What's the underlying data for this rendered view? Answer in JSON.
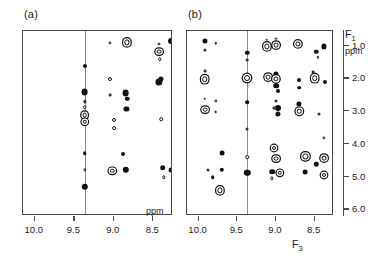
{
  "figure": {
    "panels": [
      {
        "label": "(a)",
        "xaxis": {
          "ticks": [
            "10.0",
            "9.5",
            "9.0",
            "8.5"
          ],
          "tick_ppm": [
            10.0,
            9.5,
            9.0,
            8.5
          ],
          "unit": "ppm",
          "title": "",
          "range": [
            10.15,
            8.25
          ]
        },
        "yaxis": {
          "ticks": [],
          "title": "",
          "unit": "",
          "range": [
            0.55,
            6.2
          ]
        },
        "reference_line_ppm": 9.37
      },
      {
        "label": "(b)",
        "xaxis": {
          "ticks": [
            "10.0",
            "9.5",
            "9.0",
            "8.5"
          ],
          "tick_ppm": [
            10.0,
            9.5,
            9.0,
            8.5
          ],
          "unit": "",
          "title": "F",
          "title_sub": "3",
          "range": [
            10.15,
            8.25
          ]
        },
        "yaxis": {
          "ticks": [
            "1.0",
            "2.0",
            "3.0",
            "4.0",
            "5.0",
            "6.0"
          ],
          "tick_ppm": [
            1.0,
            2.0,
            3.0,
            4.0,
            5.0,
            6.0
          ],
          "title": "F",
          "title_sub": "1",
          "unit": "ppm",
          "range": [
            0.55,
            6.2
          ]
        },
        "reference_line_ppm": 9.37
      }
    ]
  },
  "chart_data": {
    "type": "scatter",
    "title": "",
    "xlabel": "F3 (ppm)",
    "ylabel": "F1 (ppm)",
    "xlim": [
      10.15,
      8.25
    ],
    "ylim": [
      0.55,
      6.2
    ],
    "x_inverted": true,
    "y_inverted": true,
    "grid": false,
    "legend": null,
    "panels": [
      {
        "name": "(a)",
        "reference_line_x": 9.37,
        "peaks": [
          {
            "x": 9.05,
            "y": 0.92,
            "r": 1.6,
            "style": "ring"
          },
          {
            "x": 8.83,
            "y": 0.9,
            "r": 2.6,
            "style": "ring2"
          },
          {
            "x": 8.43,
            "y": 0.95,
            "r": 1.5,
            "style": "ring"
          },
          {
            "x": 8.43,
            "y": 1.18,
            "r": 2.4,
            "style": "ring2"
          },
          {
            "x": 8.42,
            "y": 1.42,
            "r": 1.8,
            "style": "ring"
          },
          {
            "x": 8.28,
            "y": 0.85,
            "r": 3.0,
            "style": "filled"
          },
          {
            "x": 9.37,
            "y": 1.62,
            "r": 2.0,
            "style": "filled"
          },
          {
            "x": 9.05,
            "y": 2.02,
            "r": 2.0,
            "style": "ring"
          },
          {
            "x": 8.43,
            "y": 2.1,
            "r": 3.6,
            "style": "filled"
          },
          {
            "x": 8.4,
            "y": 2.02,
            "r": 2.6,
            "style": "filled"
          },
          {
            "x": 9.37,
            "y": 2.42,
            "r": 3.4,
            "style": "filled"
          },
          {
            "x": 9.05,
            "y": 2.5,
            "r": 1.4,
            "style": "tiny"
          },
          {
            "x": 8.85,
            "y": 2.44,
            "r": 3.4,
            "style": "filled"
          },
          {
            "x": 8.83,
            "y": 2.62,
            "r": 2.2,
            "style": "filled"
          },
          {
            "x": 9.37,
            "y": 2.7,
            "r": 1.6,
            "style": "tiny"
          },
          {
            "x": 9.37,
            "y": 2.88,
            "r": 1.8,
            "style": "ring"
          },
          {
            "x": 8.84,
            "y": 2.92,
            "r": 2.6,
            "style": "filled"
          },
          {
            "x": 9.37,
            "y": 3.12,
            "r": 2.4,
            "style": "ring2"
          },
          {
            "x": 9.37,
            "y": 3.32,
            "r": 2.2,
            "style": "ring2"
          },
          {
            "x": 9.0,
            "y": 3.28,
            "r": 2.0,
            "style": "ring"
          },
          {
            "x": 9.0,
            "y": 3.52,
            "r": 1.9,
            "style": "ring"
          },
          {
            "x": 8.4,
            "y": 3.25,
            "r": 1.8,
            "style": "ring"
          },
          {
            "x": 9.37,
            "y": 4.28,
            "r": 1.8,
            "style": "filled"
          },
          {
            "x": 8.88,
            "y": 4.32,
            "r": 2.0,
            "style": "filled"
          },
          {
            "x": 9.37,
            "y": 4.78,
            "r": 1.7,
            "style": "ring"
          },
          {
            "x": 9.02,
            "y": 4.82,
            "r": 2.2,
            "style": "ring2"
          },
          {
            "x": 8.85,
            "y": 4.78,
            "r": 3.2,
            "style": "filled"
          },
          {
            "x": 8.38,
            "y": 4.72,
            "r": 2.8,
            "style": "filled"
          },
          {
            "x": 8.37,
            "y": 5.02,
            "r": 1.7,
            "style": "ring"
          },
          {
            "x": 8.27,
            "y": 4.8,
            "r": 2.4,
            "style": "filled"
          },
          {
            "x": 9.37,
            "y": 5.3,
            "r": 3.2,
            "style": "filled"
          }
        ]
      },
      {
        "name": "(b)",
        "reference_line_x": 9.37,
        "peaks": [
          {
            "x": 9.92,
            "y": 0.85,
            "r": 2.6,
            "style": "filled"
          },
          {
            "x": 9.92,
            "y": 1.12,
            "r": 1.6,
            "style": "tiny"
          },
          {
            "x": 9.78,
            "y": 0.92,
            "r": 1.2,
            "style": "tiny"
          },
          {
            "x": 9.37,
            "y": 1.22,
            "r": 2.2,
            "style": "filled"
          },
          {
            "x": 9.12,
            "y": 0.82,
            "r": 1.3,
            "style": "tiny"
          },
          {
            "x": 9.12,
            "y": 1.02,
            "r": 2.6,
            "style": "ring2"
          },
          {
            "x": 9.0,
            "y": 0.78,
            "r": 1.4,
            "style": "ring"
          },
          {
            "x": 9.0,
            "y": 0.98,
            "r": 2.4,
            "style": "ring2"
          },
          {
            "x": 8.72,
            "y": 0.95,
            "r": 2.6,
            "style": "ring2"
          },
          {
            "x": 8.48,
            "y": 1.18,
            "r": 2.2,
            "style": "filled"
          },
          {
            "x": 8.38,
            "y": 1.02,
            "r": 2.6,
            "style": "filled"
          },
          {
            "x": 8.46,
            "y": 1.35,
            "r": 1.2,
            "style": "tiny"
          },
          {
            "x": 9.37,
            "y": 1.45,
            "r": 1.4,
            "style": "tiny"
          },
          {
            "x": 9.92,
            "y": 1.78,
            "r": 1.4,
            "style": "tiny"
          },
          {
            "x": 9.92,
            "y": 2.02,
            "r": 2.8,
            "style": "ring2"
          },
          {
            "x": 9.37,
            "y": 1.98,
            "r": 3.0,
            "style": "ring2"
          },
          {
            "x": 9.1,
            "y": 1.95,
            "r": 2.4,
            "style": "ring2"
          },
          {
            "x": 9.0,
            "y": 1.85,
            "r": 2.6,
            "style": "filled"
          },
          {
            "x": 9.0,
            "y": 2.02,
            "r": 2.6,
            "style": "ring2"
          },
          {
            "x": 9.0,
            "y": 2.22,
            "r": 2.8,
            "style": "filled"
          },
          {
            "x": 8.98,
            "y": 2.38,
            "r": 2.0,
            "style": "filled"
          },
          {
            "x": 8.7,
            "y": 2.05,
            "r": 2.0,
            "style": "filled"
          },
          {
            "x": 8.7,
            "y": 2.28,
            "r": 1.8,
            "style": "filled"
          },
          {
            "x": 8.52,
            "y": 1.8,
            "r": 1.4,
            "style": "tiny"
          },
          {
            "x": 8.5,
            "y": 2.0,
            "r": 2.8,
            "style": "ring2"
          },
          {
            "x": 8.36,
            "y": 2.12,
            "r": 2.0,
            "style": "filled"
          },
          {
            "x": 9.92,
            "y": 2.62,
            "r": 1.3,
            "style": "tiny"
          },
          {
            "x": 9.78,
            "y": 2.68,
            "r": 1.6,
            "style": "ring"
          },
          {
            "x": 9.37,
            "y": 2.72,
            "r": 1.8,
            "style": "filled"
          },
          {
            "x": 9.0,
            "y": 2.68,
            "r": 1.5,
            "style": "tiny"
          },
          {
            "x": 8.98,
            "y": 2.9,
            "r": 3.0,
            "style": "filled"
          },
          {
            "x": 8.98,
            "y": 3.08,
            "r": 2.6,
            "style": "filled"
          },
          {
            "x": 9.02,
            "y": 2.9,
            "r": 1.6,
            "style": "tiny"
          },
          {
            "x": 8.7,
            "y": 2.78,
            "r": 2.6,
            "style": "filled"
          },
          {
            "x": 8.7,
            "y": 3.0,
            "r": 2.2,
            "style": "ring2"
          },
          {
            "x": 9.92,
            "y": 2.95,
            "r": 2.4,
            "style": "ring2"
          },
          {
            "x": 9.78,
            "y": 3.02,
            "r": 1.4,
            "style": "tiny"
          },
          {
            "x": 8.45,
            "y": 3.08,
            "r": 1.5,
            "style": "tiny"
          },
          {
            "x": 9.37,
            "y": 3.55,
            "r": 1.5,
            "style": "tiny"
          },
          {
            "x": 8.38,
            "y": 3.82,
            "r": 1.6,
            "style": "ring"
          },
          {
            "x": 9.02,
            "y": 4.12,
            "r": 2.0,
            "style": "ring2"
          },
          {
            "x": 9.7,
            "y": 4.28,
            "r": 2.4,
            "style": "filled"
          },
          {
            "x": 9.37,
            "y": 4.4,
            "r": 1.8,
            "style": "ring"
          },
          {
            "x": 9.0,
            "y": 4.45,
            "r": 2.4,
            "style": "ring2"
          },
          {
            "x": 8.62,
            "y": 4.38,
            "r": 2.6,
            "style": "ring2"
          },
          {
            "x": 8.38,
            "y": 4.42,
            "r": 2.4,
            "style": "ring2"
          },
          {
            "x": 8.48,
            "y": 4.62,
            "r": 2.2,
            "style": "filled"
          },
          {
            "x": 9.7,
            "y": 4.78,
            "r": 2.2,
            "style": "filled"
          },
          {
            "x": 9.37,
            "y": 4.88,
            "r": 3.2,
            "style": "filled"
          },
          {
            "x": 9.05,
            "y": 4.85,
            "r": 2.8,
            "style": "filled"
          },
          {
            "x": 8.95,
            "y": 4.88,
            "r": 2.2,
            "style": "ring2"
          },
          {
            "x": 8.62,
            "y": 4.85,
            "r": 2.4,
            "style": "filled"
          },
          {
            "x": 8.38,
            "y": 4.95,
            "r": 2.0,
            "style": "ring2"
          },
          {
            "x": 9.88,
            "y": 4.78,
            "r": 1.5,
            "style": "tiny"
          },
          {
            "x": 9.82,
            "y": 5.02,
            "r": 1.8,
            "style": "filled"
          },
          {
            "x": 9.05,
            "y": 5.05,
            "r": 1.7,
            "style": "ring"
          },
          {
            "x": 9.72,
            "y": 5.42,
            "r": 2.6,
            "style": "ring2"
          }
        ]
      }
    ]
  }
}
